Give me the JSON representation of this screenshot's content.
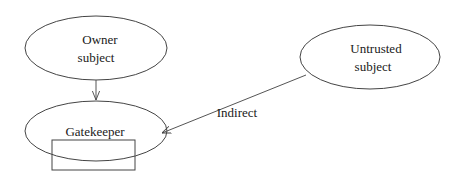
{
  "diagram": {
    "nodes": {
      "owner": {
        "line1": "Owner",
        "line2": "subject"
      },
      "untrusted": {
        "line1": "Untrusted",
        "line2": "subject"
      },
      "gatekeeper": {
        "label": "Gatekeeper"
      }
    },
    "edges": {
      "owner_to_gatekeeper": {
        "label": ""
      },
      "untrusted_to_gatekeeper": {
        "label": "Indirect"
      }
    },
    "colors": {
      "stroke": "#444444",
      "text": "#1a1a1a",
      "background": "#ffffff"
    }
  }
}
